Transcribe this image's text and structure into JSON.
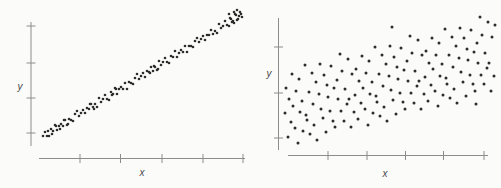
{
  "figure": {
    "background": "#fbfbfa",
    "axis_color": "#8c8c8c",
    "label_color": "#4a4a4a",
    "dot_color": "#2d2d2d"
  },
  "chart_data": [
    {
      "type": "scatter",
      "panel": "left",
      "title": "",
      "xlabel": "x",
      "ylabel": "y",
      "tick_labels": "none (unlabeled generic axes)",
      "grid": "off",
      "legend": "none",
      "trend": "strong positive linear correlation, tight narrow band of points",
      "layout_px": {
        "y_axis": {
          "x": 31,
          "y1": 22,
          "y2": 146
        },
        "x_axis": {
          "y": 158.5,
          "x1": 39,
          "x2": 245
        },
        "y_tick_ys": [
          26,
          63,
          98,
          133
        ],
        "x_tick_xs": [
          80,
          120.5,
          162,
          203,
          243
        ],
        "tick_half_len": 4.5,
        "ylabel_pos": [
          20,
          90
        ],
        "xlabel_pos": [
          142,
          176
        ],
        "dot_r": 1.3
      },
      "points_px": [
        [
          43,
          136
        ],
        [
          45,
          132
        ],
        [
          47,
          136
        ],
        [
          49,
          136
        ],
        [
          51,
          129
        ],
        [
          53,
          131
        ],
        [
          55,
          125
        ],
        [
          57,
          130
        ],
        [
          59,
          126
        ],
        [
          61,
          124
        ],
        [
          63,
          126
        ],
        [
          65,
          120
        ],
        [
          67,
          125
        ],
        [
          69,
          119
        ],
        [
          71,
          120
        ],
        [
          73,
          121
        ],
        [
          75,
          114
        ],
        [
          77,
          111
        ],
        [
          79,
          116
        ],
        [
          81,
          113
        ],
        [
          83,
          110
        ],
        [
          85,
          113
        ],
        [
          87,
          108
        ],
        [
          89,
          109
        ],
        [
          91,
          104
        ],
        [
          93,
          107
        ],
        [
          95,
          104
        ],
        [
          97,
          107
        ],
        [
          99,
          98
        ],
        [
          101,
          102
        ],
        [
          103,
          99
        ],
        [
          105,
          95
        ],
        [
          107,
          99
        ],
        [
          109,
          100
        ],
        [
          111,
          92
        ],
        [
          113,
          94
        ],
        [
          115,
          88
        ],
        [
          117,
          94
        ],
        [
          119,
          89
        ],
        [
          121,
          87
        ],
        [
          123,
          89
        ],
        [
          125,
          83
        ],
        [
          127,
          89
        ],
        [
          129,
          82
        ],
        [
          131,
          83
        ],
        [
          133,
          84
        ],
        [
          135,
          78
        ],
        [
          137,
          74
        ],
        [
          139,
          79
        ],
        [
          141,
          76
        ],
        [
          143,
          73
        ],
        [
          145,
          77
        ],
        [
          147,
          71
        ],
        [
          149,
          72
        ],
        [
          151,
          67
        ],
        [
          153,
          71
        ],
        [
          155,
          67
        ],
        [
          157,
          70
        ],
        [
          159,
          61
        ],
        [
          161,
          65
        ],
        [
          163,
          62
        ],
        [
          165,
          58
        ],
        [
          167,
          62
        ],
        [
          169,
          63
        ],
        [
          171,
          56
        ],
        [
          173,
          57
        ],
        [
          175,
          51
        ],
        [
          177,
          57
        ],
        [
          179,
          53
        ],
        [
          181,
          50
        ],
        [
          183,
          52
        ],
        [
          185,
          46
        ],
        [
          187,
          52
        ],
        [
          189,
          46
        ],
        [
          191,
          46
        ],
        [
          193,
          47
        ],
        [
          195,
          41
        ],
        [
          197,
          38
        ],
        [
          199,
          42
        ],
        [
          201,
          39
        ],
        [
          203,
          36
        ],
        [
          205,
          40
        ],
        [
          207,
          35
        ],
        [
          209,
          35
        ],
        [
          211,
          30
        ],
        [
          213,
          34
        ],
        [
          215,
          31
        ],
        [
          217,
          33
        ],
        [
          219,
          24
        ],
        [
          221,
          28
        ],
        [
          223,
          26
        ],
        [
          225,
          21
        ],
        [
          227,
          25
        ],
        [
          229,
          26
        ],
        [
          231,
          19
        ],
        [
          233,
          21
        ],
        [
          235,
          14
        ],
        [
          237,
          20
        ],
        [
          239,
          16
        ],
        [
          241,
          14
        ],
        [
          48,
          131
        ],
        [
          52,
          134
        ],
        [
          56,
          126
        ],
        [
          60,
          129
        ],
        [
          64,
          120
        ],
        [
          68,
          124
        ],
        [
          90,
          104
        ],
        [
          94,
          109
        ],
        [
          112,
          95
        ],
        [
          116,
          89
        ],
        [
          150,
          73
        ],
        [
          154,
          66
        ],
        [
          158,
          69
        ],
        [
          229,
          14
        ],
        [
          230,
          18
        ],
        [
          232,
          22
        ],
        [
          234,
          12
        ],
        [
          234,
          23
        ],
        [
          236,
          15
        ],
        [
          237,
          10
        ],
        [
          238,
          19
        ],
        [
          240,
          12
        ],
        [
          242,
          17
        ]
      ]
    },
    {
      "type": "scatter",
      "panel": "right",
      "title": "",
      "xlabel": "x",
      "ylabel": "y",
      "tick_labels": "none (unlabeled generic axes)",
      "grid": "off",
      "legend": "none",
      "trend": "weak-to-moderate positive correlation, widely dispersed cloud of points",
      "layout_px": {
        "y_axis": {
          "x": 278.5,
          "y1": 18,
          "y2": 150
        },
        "x_axis": {
          "y": 155.5,
          "x1": 288,
          "x2": 488
        },
        "y_tick_ys": [
          47,
          93,
          138
        ],
        "x_tick_xs": [
          328,
          367,
          405.5,
          443.5,
          484
        ],
        "tick_half_len": 4.5,
        "ylabel_pos": [
          269,
          77
        ],
        "xlabel_pos": [
          385,
          177
        ],
        "dot_r": 1.5
      },
      "points_px": [
        [
          285,
          113
        ],
        [
          286,
          88
        ],
        [
          288,
          137
        ],
        [
          289,
          99
        ],
        [
          291,
          122
        ],
        [
          292,
          74
        ],
        [
          293,
          106
        ],
        [
          295,
          128
        ],
        [
          296,
          91
        ],
        [
          298,
          143
        ],
        [
          299,
          79
        ],
        [
          300,
          112
        ],
        [
          302,
          101
        ],
        [
          303,
          131
        ],
        [
          305,
          65
        ],
        [
          306,
          115
        ],
        [
          307,
          120
        ],
        [
          309,
          92
        ],
        [
          310,
          134
        ],
        [
          312,
          73
        ],
        [
          313,
          104
        ],
        [
          314,
          125
        ],
        [
          316,
          82
        ],
        [
          317,
          140
        ],
        [
          319,
          94
        ],
        [
          320,
          64
        ],
        [
          321,
          109
        ],
        [
          323,
          118
        ],
        [
          324,
          75
        ],
        [
          326,
          132
        ],
        [
          327,
          85
        ],
        [
          328,
          97
        ],
        [
          330,
          111
        ],
        [
          331,
          66
        ],
        [
          333,
          121
        ],
        [
          334,
          88
        ],
        [
          335,
          127
        ],
        [
          337,
          80
        ],
        [
          338,
          99
        ],
        [
          340,
          54
        ],
        [
          341,
          111
        ],
        [
          342,
          71
        ],
        [
          344,
          121
        ],
        [
          345,
          89
        ],
        [
          347,
          104
        ],
        [
          348,
          59
        ],
        [
          349,
          99
        ],
        [
          351,
          127
        ],
        [
          352,
          74
        ],
        [
          354,
          112
        ],
        [
          355,
          95
        ],
        [
          356,
          69
        ],
        [
          358,
          119
        ],
        [
          359,
          81
        ],
        [
          361,
          103
        ],
        [
          362,
          56
        ],
        [
          363,
          88
        ],
        [
          365,
          109
        ],
        [
          366,
          73
        ],
        [
          368,
          125
        ],
        [
          369,
          61
        ],
        [
          370,
          94
        ],
        [
          372,
          82
        ],
        [
          373,
          113
        ],
        [
          375,
          47
        ],
        [
          376,
          96
        ],
        [
          377,
          102
        ],
        [
          379,
          74
        ],
        [
          380,
          116
        ],
        [
          382,
          55
        ],
        [
          383,
          86
        ],
        [
          384,
          107
        ],
        [
          386,
          64
        ],
        [
          387,
          121
        ],
        [
          389,
          76
        ],
        [
          390,
          46
        ],
        [
          391,
          90
        ],
        [
          393,
          100
        ],
        [
          394,
          57
        ],
        [
          396,
          114
        ],
        [
          397,
          67
        ],
        [
          398,
          79
        ],
        [
          400,
          93
        ],
        [
          401,
          48
        ],
        [
          403,
          102
        ],
        [
          404,
          70
        ],
        [
          405,
          109
        ],
        [
          407,
          61
        ],
        [
          408,
          81
        ],
        [
          410,
          36
        ],
        [
          411,
          93
        ],
        [
          412,
          53
        ],
        [
          414,
          103
        ],
        [
          415,
          71
        ],
        [
          417,
          86
        ],
        [
          418,
          40
        ],
        [
          419,
          81
        ],
        [
          421,
          109
        ],
        [
          422,
          55
        ],
        [
          424,
          94
        ],
        [
          425,
          77
        ],
        [
          426,
          51
        ],
        [
          428,
          101
        ],
        [
          429,
          63
        ],
        [
          431,
          85
        ],
        [
          432,
          38
        ],
        [
          433,
          69
        ],
        [
          435,
          91
        ],
        [
          436,
          55
        ],
        [
          438,
          106
        ],
        [
          439,
          43
        ],
        [
          440,
          76
        ],
        [
          442,
          64
        ],
        [
          443,
          95
        ],
        [
          445,
          29
        ],
        [
          446,
          78
        ],
        [
          447,
          84
        ],
        [
          449,
          55
        ],
        [
          450,
          98
        ],
        [
          452,
          37
        ],
        [
          453,
          67
        ],
        [
          454,
          89
        ],
        [
          456,
          46
        ],
        [
          457,
          103
        ],
        [
          459,
          58
        ],
        [
          460,
          28
        ],
        [
          461,
          72
        ],
        [
          463,
          82
        ],
        [
          464,
          38
        ],
        [
          466,
          96
        ],
        [
          467,
          49
        ],
        [
          468,
          60
        ],
        [
          470,
          75
        ],
        [
          471,
          30
        ],
        [
          473,
          84
        ],
        [
          474,
          52
        ],
        [
          475,
          91
        ],
        [
          477,
          43
        ],
        [
          478,
          63
        ],
        [
          480,
          17
        ],
        [
          481,
          75
        ],
        [
          482,
          35
        ],
        [
          484,
          84
        ],
        [
          485,
          53
        ],
        [
          487,
          68
        ],
        [
          488,
          22
        ],
        [
          489,
          63
        ],
        [
          491,
          91
        ],
        [
          492,
          37
        ],
        [
          494,
          76
        ],
        [
          476,
          104
        ],
        [
          495,
          25
        ],
        [
          392,
          27
        ]
      ]
    }
  ]
}
